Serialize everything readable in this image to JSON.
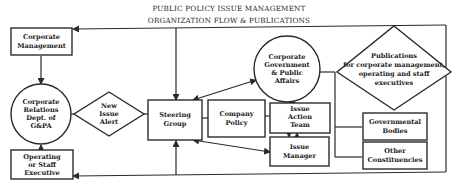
{
  "title": {
    "line1": "PUBLIC POLICY ISSUE MANAGEMENT",
    "line2": "ORGANIZATION FLOW & PUBLICATIONS"
  },
  "nodes": {
    "corporate_management": {
      "shape": "rectangle",
      "lines": [
        "Corporate",
        "Management"
      ]
    },
    "corporate_relations": {
      "shape": "circle",
      "lines": [
        "Corporate",
        "Relations",
        "Dept. of",
        "G&PA"
      ]
    },
    "new_issue_alert": {
      "shape": "diamond",
      "lines": [
        "New",
        "Issue",
        "Alert"
      ]
    },
    "operating_staff_executive": {
      "shape": "rectangle",
      "lines": [
        "Operating",
        "or Staff",
        "Executive"
      ]
    },
    "steering_group": {
      "shape": "rectangle",
      "lines": [
        "Steering",
        "Group"
      ]
    },
    "company_policy": {
      "shape": "rectangle",
      "lines": [
        "Company",
        "Policy"
      ]
    },
    "issue_action_team": {
      "shape": "rectangle",
      "lines": [
        "Issue",
        "Action",
        "Team"
      ]
    },
    "issue_manager": {
      "shape": "rectangle",
      "lines": [
        "Issue",
        "Manager"
      ]
    },
    "corporate_government": {
      "shape": "circle",
      "lines": [
        "Corporate",
        "Government",
        "& Public",
        "Affairs"
      ]
    },
    "publications": {
      "shape": "diamond",
      "lines": [
        "Publications",
        "for corporate management,",
        "operating and staff",
        "executives"
      ]
    },
    "governmental_bodies": {
      "shape": "rectangle",
      "lines": [
        "Governmental",
        "Bodies"
      ]
    },
    "other_constituencies": {
      "shape": "rectangle",
      "lines": [
        "Other",
        "Constituencies"
      ]
    }
  },
  "edges": [
    {
      "from": "publications",
      "to": "corporate_management",
      "arrow": "end"
    },
    {
      "from": "publications",
      "to": "operating_staff_executive",
      "arrow": "end"
    },
    {
      "from": "corporate_management",
      "to": "corporate_relations",
      "arrow": "end"
    },
    {
      "from": "operating_staff_executive",
      "to": "corporate_relations",
      "arrow": "end"
    },
    {
      "from": "corporate_relations",
      "to": "new_issue_alert",
      "arrow": "none"
    },
    {
      "from": "new_issue_alert",
      "to": "steering_group",
      "arrow": "none"
    },
    {
      "from": "top_line",
      "to": "steering_group",
      "arrow": "end"
    },
    {
      "from": "bottom_line",
      "to": "steering_group",
      "arrow": "end"
    },
    {
      "from": "steering_group",
      "to": "corporate_government",
      "arrow": "both"
    },
    {
      "from": "steering_group",
      "to": "issue_manager",
      "arrow": "both"
    },
    {
      "from": "steering_group",
      "to": "company_policy",
      "arrow": "none"
    },
    {
      "from": "company_policy",
      "to": "issue_action_team",
      "arrow": "none"
    },
    {
      "from": "issue_action_team",
      "to": "corporate_government",
      "arrow": "both"
    },
    {
      "from": "issue_action_team",
      "to": "issue_manager",
      "arrow": "both"
    },
    {
      "from": "corporate_government",
      "to": "publications",
      "arrow": "none"
    },
    {
      "from": "publications",
      "to": "governmental_bodies",
      "arrow": "none"
    },
    {
      "from": "publications",
      "to": "other_constituencies",
      "arrow": "none"
    }
  ],
  "colors": {
    "line": "#2b2b2b",
    "fill": "#ffffff",
    "text": "#222222"
  }
}
